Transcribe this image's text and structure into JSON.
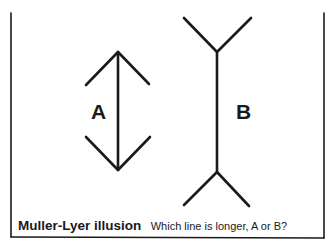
{
  "figure": {
    "label_a": "A",
    "label_b": "B",
    "caption_title": "Muller-Lyer illusion",
    "caption_question": "Which line is longer, A or B?",
    "ink_color": "#1a1a1a",
    "background_color": "#ffffff"
  },
  "lines": [
    {
      "id": "A",
      "type": "arrowheads-inward",
      "x": 118,
      "y_top": 52,
      "y_bottom": 170
    },
    {
      "id": "B",
      "type": "fins-outward",
      "x": 217,
      "y_top": 52,
      "y_bottom": 172
    }
  ]
}
